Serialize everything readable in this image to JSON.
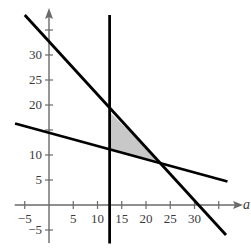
{
  "chart_data": {
    "type": "line",
    "title": "",
    "xlabel": "a",
    "ylabel": "b",
    "xlim": [
      -7,
      39
    ],
    "ylim": [
      -7,
      39
    ],
    "grid": false,
    "x_ticks": [
      -5,
      5,
      10,
      15,
      20,
      25,
      30,
      35
    ],
    "x_tick_labels": [
      "−5",
      "5",
      "10",
      "15",
      "20",
      "25",
      "30",
      ""
    ],
    "y_ticks": [
      -5,
      5,
      10,
      15,
      20,
      25,
      30,
      35
    ],
    "y_tick_labels": [
      "−5",
      "5",
      "10",
      "",
      "20",
      "25",
      "30",
      ""
    ],
    "series": [
      {
        "name": "steep line",
        "points": [
          [
            -5,
            38
          ],
          [
            36.5,
            -6
          ]
        ],
        "color": "#000000"
      },
      {
        "name": "shallow line",
        "points": [
          [
            -7,
            16.3
          ],
          [
            36.8,
            4.7
          ]
        ],
        "color": "#000000"
      },
      {
        "name": "vertical line",
        "points": [
          [
            12.5,
            38
          ],
          [
            12.5,
            -7.7
          ]
        ],
        "color": "#000000"
      }
    ],
    "shaded_region": {
      "vertices": [
        [
          12.5,
          18.6
        ],
        [
          12.5,
          11
        ],
        [
          22.7,
          8.8
        ]
      ],
      "color": "#c8c8c8"
    }
  },
  "labels": {
    "x_axis": "a",
    "y_axis": "b"
  }
}
